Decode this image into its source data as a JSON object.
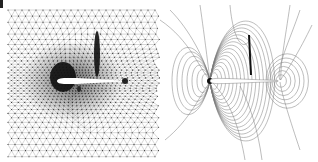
{
  "figure": {
    "panels": [
      {
        "id": "mesh",
        "description": "Adaptive unstructured triangular mesh around an airfoil",
        "mesh": {
          "bounds": {
            "x0": 8,
            "y0": 10,
            "x1": 160,
            "y1": 158
          },
          "coarse_spacing": 7,
          "fine_spacing": 3,
          "line_color": "#8a8a8a",
          "node_color": "#333333"
        },
        "airfoil": {
          "x0": 57,
          "x1": 121,
          "y": 81,
          "thickness": 6,
          "fill": "#ffffff"
        },
        "refinement_regions": [
          {
            "name": "leading-edge-cluster",
            "cx": 63,
            "cy": 77,
            "rx": 13,
            "ry": 15,
            "color": "#111111"
          },
          {
            "name": "shock-streak",
            "cx": 97,
            "cy": 54,
            "rx": 3,
            "ry": 23,
            "color": "#111111"
          },
          {
            "name": "trailing-edge-dot",
            "cx": 125,
            "cy": 81,
            "rx": 3,
            "ry": 3,
            "color": "#111111"
          },
          {
            "name": "lower-spot",
            "cx": 79,
            "cy": 89,
            "rx": 2,
            "ry": 3,
            "color": "#222222"
          }
        ]
      },
      {
        "id": "contours",
        "description": "Flow field contour lines around the same airfoil",
        "airfoil": {
          "x0": 210,
          "x1": 278,
          "y": 81,
          "thickness": 5
        },
        "line_color": "#7a7a7a",
        "shock": {
          "x": 250,
          "y0": 35,
          "y1": 75,
          "color": "#111111"
        },
        "leading_edge": {
          "x": 210,
          "y": 81
        },
        "trailing_edge": {
          "x": 280,
          "y": 81
        }
      }
    ],
    "corner_mark": true
  }
}
